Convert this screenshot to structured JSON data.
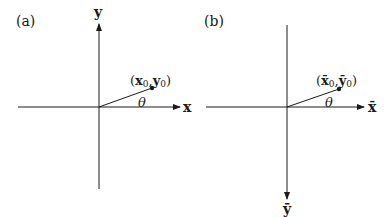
{
  "panels": [
    {
      "id": "a",
      "label": "(a)",
      "x_axis_label": "x",
      "y_axis_label": "y",
      "point_label": {
        "open": "(",
        "x": "x",
        "x_sub": "0",
        "sep": ",",
        "y": "y",
        "y_sub": "0",
        "close": ")"
      },
      "angle_label": "θ",
      "y_axis_direction": "up"
    },
    {
      "id": "b",
      "label": "(b)",
      "x_axis_label": "x̄",
      "y_axis_label": "ȳ",
      "point_label": {
        "open": "(",
        "x": "x̄",
        "x_sub": "0",
        "sep": ",",
        "y": "ȳ",
        "y_sub": "0",
        "close": ")"
      },
      "angle_label": "θ",
      "y_axis_direction": "down"
    }
  ]
}
